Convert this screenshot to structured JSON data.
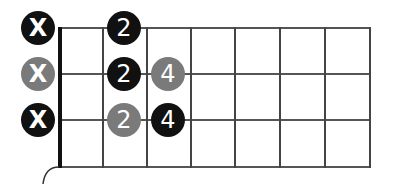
{
  "diagram": {
    "type": "guitar-chord-fretboard",
    "strings_shown": 3,
    "frets_shown": 7,
    "colors": {
      "black": "#111111",
      "gray": "#7a7a7a",
      "grid": "#555555",
      "nut": "#111111"
    },
    "muted_markers": [
      {
        "string": 1,
        "label": "X",
        "color": "black"
      },
      {
        "string": 2,
        "label": "X",
        "color": "gray"
      },
      {
        "string": 3,
        "label": "X",
        "color": "black"
      }
    ],
    "finger_dots": [
      {
        "string": 1,
        "fret": 1,
        "label": "2",
        "color": "black"
      },
      {
        "string": 2,
        "fret": 1,
        "label": "2",
        "color": "black"
      },
      {
        "string": 2,
        "fret": 2,
        "label": "4",
        "color": "gray"
      },
      {
        "string": 3,
        "fret": 1,
        "label": "2",
        "color": "gray"
      },
      {
        "string": 3,
        "fret": 2,
        "label": "4",
        "color": "black"
      }
    ]
  }
}
